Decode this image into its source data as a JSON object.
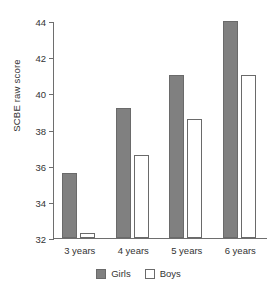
{
  "chart_data": {
    "type": "bar",
    "title": "",
    "subtitle": "",
    "xlabel": "",
    "ylabel": "SCBE raw score",
    "categories": [
      "3 years",
      "4 years",
      "5 years",
      "6 years"
    ],
    "series": [
      {
        "name": "Girls",
        "color": "#808080",
        "values": [
          35.6,
          39.2,
          41.0,
          44.0
        ]
      },
      {
        "name": "Boys",
        "color": "#ffffff",
        "values": [
          32.3,
          36.6,
          38.6,
          41.0
        ]
      }
    ],
    "ylim": [
      32,
      44
    ],
    "yticks": [
      32,
      34,
      36,
      38,
      40,
      42,
      44
    ],
    "ytick_labels": [
      "32",
      "34",
      "36",
      "38",
      "40",
      "42",
      "44"
    ],
    "grid": false,
    "legend_position": "bottom"
  },
  "legend": {
    "entries": [
      {
        "label": "Girls",
        "swatch": "filled-square-icon"
      },
      {
        "label": "Boys",
        "swatch": "open-square-icon"
      }
    ]
  }
}
